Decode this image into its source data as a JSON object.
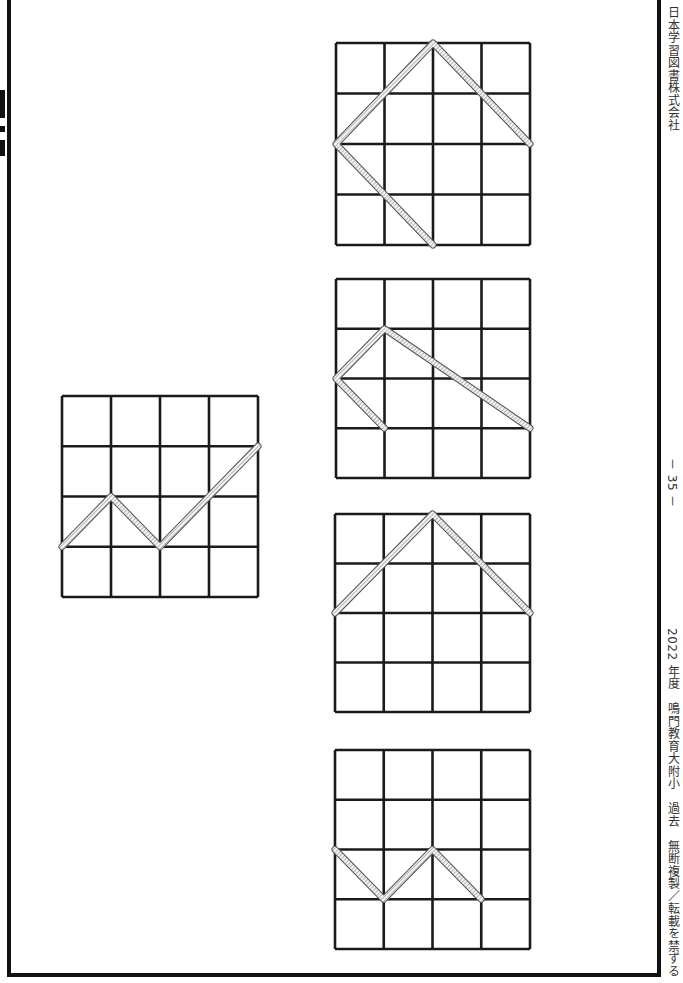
{
  "page": {
    "page_number": "－ 35 －",
    "publisher": "日本学習図書株式会社",
    "footer_left": "2022 年度　鳴門教育大附小　過去　無断複製／転載を禁ずる"
  },
  "colors": {
    "border": "#111111",
    "grid_line": "#1a1a1a",
    "path_fill": "#e8e8e8",
    "path_stroke": "#555555"
  },
  "example_grid": {
    "label": "example",
    "size": 4,
    "path": [
      [
        0,
        3
      ],
      [
        1,
        2
      ],
      [
        2,
        3
      ],
      [
        4,
        1
      ]
    ]
  },
  "answer_grids": [
    {
      "label": "option-1",
      "size": 4,
      "paths": [
        [
          [
            2,
            4
          ],
          [
            0,
            2
          ],
          [
            2,
            0
          ],
          [
            4,
            2
          ]
        ]
      ]
    },
    {
      "label": "option-2",
      "size": 4,
      "paths": [
        [
          [
            1,
            3
          ],
          [
            0,
            2
          ],
          [
            1,
            1
          ],
          [
            4,
            3
          ]
        ]
      ]
    },
    {
      "label": "option-3",
      "size": 4,
      "paths": [
        [
          [
            0,
            2
          ],
          [
            2,
            0
          ],
          [
            4,
            2
          ]
        ]
      ]
    },
    {
      "label": "option-4",
      "size": 4,
      "paths": [
        [
          [
            0,
            2
          ],
          [
            1,
            3
          ],
          [
            2,
            2
          ],
          [
            3,
            3
          ]
        ]
      ]
    }
  ]
}
